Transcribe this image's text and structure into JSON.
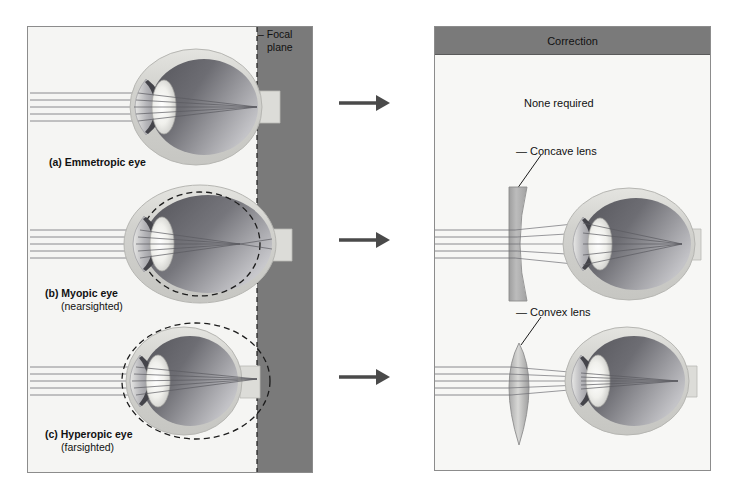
{
  "figure": {
    "title_left": "",
    "left_panel": {
      "focal_plane_label_line1": "Focal",
      "focal_plane_label_line2": "plane",
      "rows": [
        {
          "id": "a",
          "marker": "(a)",
          "label": "Emmetropic eye",
          "sub": ""
        },
        {
          "id": "b",
          "marker": "(b)",
          "label": "Myopic eye",
          "sub": "(nearsighted)"
        },
        {
          "id": "c",
          "marker": "(c)",
          "label": "Hyperopic eye",
          "sub": "(farsighted)"
        }
      ]
    },
    "right_panel": {
      "header": "Correction",
      "rows": [
        {
          "id": "a",
          "text": "None required"
        },
        {
          "id": "b",
          "text": "Concave lens"
        },
        {
          "id": "c",
          "text": "Convex lens"
        }
      ]
    },
    "arrows": [
      {
        "id": "arrow-a",
        "direction": "right"
      },
      {
        "id": "arrow-b",
        "direction": "right"
      },
      {
        "id": "arrow-c",
        "direction": "right"
      }
    ]
  },
  "colors": {
    "focal_plane_fill": "#7a7a7a",
    "panel_background": "#f5f5f3",
    "header_band": "#7a7a7a",
    "sclera": "#d6d6d2",
    "vitreous_dark": "#6f6f74",
    "vitreous_light": "#b9b9bd",
    "lens_highlight": "#f2f2ee",
    "iris_dark": "#4e4e52",
    "ray_line": "#6b6b70",
    "arrow": "#4a4a4a",
    "text": "#111111",
    "border": "#8c8c8c",
    "lens_glass": "#b5b5b5"
  }
}
